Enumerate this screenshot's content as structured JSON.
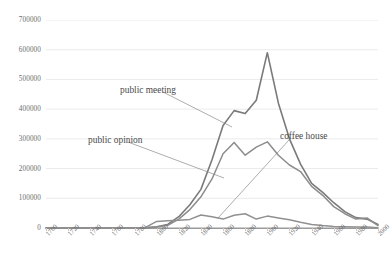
{
  "chart_data": {
    "type": "line",
    "title": "",
    "xlabel": "",
    "ylabel": "",
    "xlim": [
      1700,
      2000
    ],
    "ylim": [
      0,
      700000
    ],
    "grid": true,
    "legend_position": "inline-annotations",
    "x": [
      1700,
      1710,
      1720,
      1730,
      1740,
      1750,
      1760,
      1770,
      1780,
      1790,
      1800,
      1810,
      1820,
      1830,
      1840,
      1850,
      1860,
      1870,
      1880,
      1890,
      1900,
      1910,
      1920,
      1930,
      1940,
      1950,
      1960,
      1970,
      1980,
      1990,
      2000
    ],
    "y_ticks": [
      0,
      100000,
      200000,
      300000,
      400000,
      500000,
      600000,
      700000
    ],
    "x_tick_labels": [
      "1700",
      "1720",
      "1740",
      "1760",
      "1780",
      "1800",
      "1820",
      "1840",
      "1860",
      "1880",
      "1900",
      "1920",
      "1940",
      "1960",
      "1980",
      "2000"
    ],
    "series": [
      {
        "name": "public meeting",
        "color": "#7a7a7a",
        "values": [
          0,
          0,
          0,
          0,
          0,
          0,
          0,
          0,
          0,
          1000,
          4000,
          12000,
          38000,
          78000,
          130000,
          230000,
          345000,
          395000,
          385000,
          430000,
          590000,
          420000,
          300000,
          215000,
          150000,
          120000,
          85000,
          55000,
          35000,
          30000,
          12000
        ]
      },
      {
        "name": "public opinion",
        "color": "#8c8c8c",
        "values": [
          0,
          0,
          0,
          0,
          0,
          0,
          0,
          0,
          0,
          500,
          3000,
          9000,
          30000,
          62000,
          105000,
          165000,
          250000,
          288000,
          245000,
          272000,
          290000,
          245000,
          212000,
          190000,
          140000,
          110000,
          72000,
          48000,
          30000,
          34000,
          8000
        ]
      },
      {
        "name": "coffee house",
        "color": "#909090",
        "values": [
          0,
          0,
          0,
          0,
          0,
          0,
          0,
          0,
          0,
          2000,
          22000,
          24000,
          26000,
          29000,
          44000,
          38000,
          30000,
          43000,
          48000,
          30000,
          40000,
          34000,
          28000,
          19000,
          12000,
          8000,
          5000,
          4000,
          3000,
          3000,
          1000
        ]
      }
    ],
    "annotations": [
      {
        "label": "public meeting",
        "x_px": 120,
        "y_px": 85
      },
      {
        "label": "public opinion",
        "x_px": 88,
        "y_px": 135
      },
      {
        "label": "coffee house",
        "x_px": 280,
        "y_px": 131
      }
    ]
  }
}
